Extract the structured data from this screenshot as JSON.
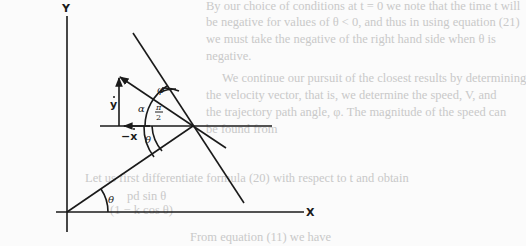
{
  "background_text": [
    "By our choice of conditions at t = 0 we note that the time t will",
    "be negative for values of θ < 0, and thus in using equation (21)",
    "we must take the negative of the right hand side when θ is",
    "negative.",
    "We continue our pursuit of the closest results by determining",
    "the velocity vector, that is, we determine the speed, V, and",
    "the trajectory path angle, φ. The magnitude of the speed can",
    "be found from",
    "Let us first differentiate formula (20) with respect to t and obtain",
    "pd sin θ",
    "(1 − k cos θ)",
    "From equation (11) we have"
  ],
  "diagram": {
    "axis_y_label": "Y",
    "axis_x_label": "X",
    "velocity_y_label": "y",
    "velocity_x_label": "−x",
    "angle_labels": {
      "theta_origin": "θ",
      "theta_point": "θ",
      "alpha": "α",
      "phi": "φ",
      "pi_over_2_num": "π",
      "pi_over_2_den": "2"
    }
  }
}
